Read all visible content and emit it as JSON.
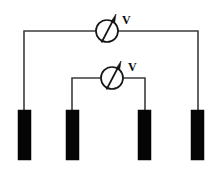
{
  "diagram": {
    "background_color": "#ffffff",
    "wire_color": "#3c3c3c",
    "electrode_color": "#050505",
    "meter_color": "#151515",
    "label_color": "#0a0a0a"
  },
  "meters": [
    {
      "id": "outer-voltmeter",
      "label": "V",
      "symbol": "voltmeter",
      "cx": 107,
      "cy": 31,
      "r": 11,
      "label_x": 122,
      "label_y": 24
    },
    {
      "id": "inner-voltmeter",
      "label": "V",
      "symbol": "voltmeter",
      "cx": 112,
      "cy": 78,
      "r": 11,
      "label_x": 128,
      "label_y": 71
    }
  ],
  "electrodes": [
    {
      "id": "electrode-1",
      "x": 18,
      "y": 110,
      "width": 13,
      "height": 50,
      "lead_x": 24,
      "lead_top": 31
    },
    {
      "id": "electrode-2",
      "x": 66,
      "y": 110,
      "width": 13,
      "height": 50,
      "lead_x": 72,
      "lead_top": 78
    },
    {
      "id": "electrode-3",
      "x": 138,
      "y": 110,
      "width": 13,
      "height": 50,
      "lead_x": 145,
      "lead_top": 78
    },
    {
      "id": "electrode-4",
      "x": 191,
      "y": 110,
      "width": 13,
      "height": 50,
      "lead_x": 198,
      "lead_top": 31
    }
  ],
  "wires": [
    {
      "id": "outer-wire-left",
      "path": "M 24 110 L 24 31 L 96 31"
    },
    {
      "id": "outer-wire-right",
      "path": "M 118 31 L 198 31 L 198 110"
    },
    {
      "id": "inner-wire-left",
      "path": "M 72 110 L 72 78 L 101 78"
    },
    {
      "id": "inner-wire-right",
      "path": "M 123 78 L 145 78 L 145 110"
    }
  ]
}
